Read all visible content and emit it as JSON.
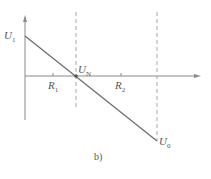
{
  "diagram": {
    "caption": "b)",
    "labels": {
      "u1": {
        "main": "U",
        "sub": "1"
      },
      "un": {
        "main": "U",
        "sub": "N"
      },
      "u0": {
        "main": "U",
        "sub": "0"
      },
      "r1": {
        "main": "R",
        "sub": "1"
      },
      "r2": {
        "main": "R",
        "sub": "2"
      }
    },
    "colors": {
      "axis": "#8a8a8a",
      "line": "#6e6e6e",
      "dashed": "#a8a8a8",
      "text": "#555555"
    }
  }
}
